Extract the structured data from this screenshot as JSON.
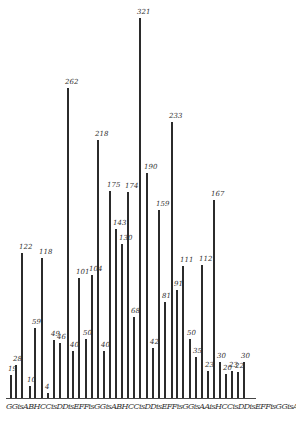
{
  "chart_data": {
    "type": "bar",
    "title": "",
    "xlabel": "",
    "ylabel": "",
    "grid": false,
    "x_axis_label_string": "GGisABHCCisDDisEFFisGGisABHCCisDDisEFFisGGisAAisHCCisDDisEFFisGGisABHCCisD'",
    "bars": [
      {
        "x": 10,
        "value": 19
      },
      {
        "x": 15,
        "value": 28
      },
      {
        "x": 21,
        "value": 122
      },
      {
        "x": 29,
        "value": 10
      },
      {
        "x": 34,
        "value": 59
      },
      {
        "x": 41,
        "value": 118
      },
      {
        "x": 47,
        "value": 4
      },
      {
        "x": 53,
        "value": 49
      },
      {
        "x": 59,
        "value": 46
      },
      {
        "x": 67,
        "value": 262
      },
      {
        "x": 72,
        "value": 40
      },
      {
        "x": 78,
        "value": 101
      },
      {
        "x": 85,
        "value": 50
      },
      {
        "x": 91,
        "value": 104
      },
      {
        "x": 97,
        "value": 218
      },
      {
        "x": 103,
        "value": 40
      },
      {
        "x": 109,
        "value": 175
      },
      {
        "x": 115,
        "value": 143
      },
      {
        "x": 121,
        "value": 130
      },
      {
        "x": 127,
        "value": 174
      },
      {
        "x": 133,
        "value": 68
      },
      {
        "x": 139,
        "value": 321
      },
      {
        "x": 146,
        "value": 190
      },
      {
        "x": 152,
        "value": 42
      },
      {
        "x": 158,
        "value": 159
      },
      {
        "x": 164,
        "value": 81
      },
      {
        "x": 171,
        "value": 233
      },
      {
        "x": 176,
        "value": 91
      },
      {
        "x": 182,
        "value": 111
      },
      {
        "x": 189,
        "value": 50
      },
      {
        "x": 195,
        "value": 35
      },
      {
        "x": 201,
        "value": 112
      },
      {
        "x": 207,
        "value": 23
      },
      {
        "x": 213,
        "value": 167
      },
      {
        "x": 219,
        "value": 30
      },
      {
        "x": 225,
        "value": 20
      },
      {
        "x": 231,
        "value": 23
      },
      {
        "x": 237,
        "value": 22
      },
      {
        "x": 243,
        "value": 30
      }
    ],
    "labels": [
      "19",
      "28",
      "122",
      "10",
      "59",
      "118",
      "4",
      "49",
      "46",
      "262",
      "40",
      "101",
      "50",
      "104",
      "218",
      "40",
      "175",
      "143",
      "130",
      "174",
      "68",
      "321",
      "190",
      "42",
      "159",
      "81",
      "233",
      "91",
      "111",
      "50",
      "35",
      "112",
      "23",
      "167",
      "30",
      "20",
      "23",
      "22",
      "30"
    ]
  }
}
